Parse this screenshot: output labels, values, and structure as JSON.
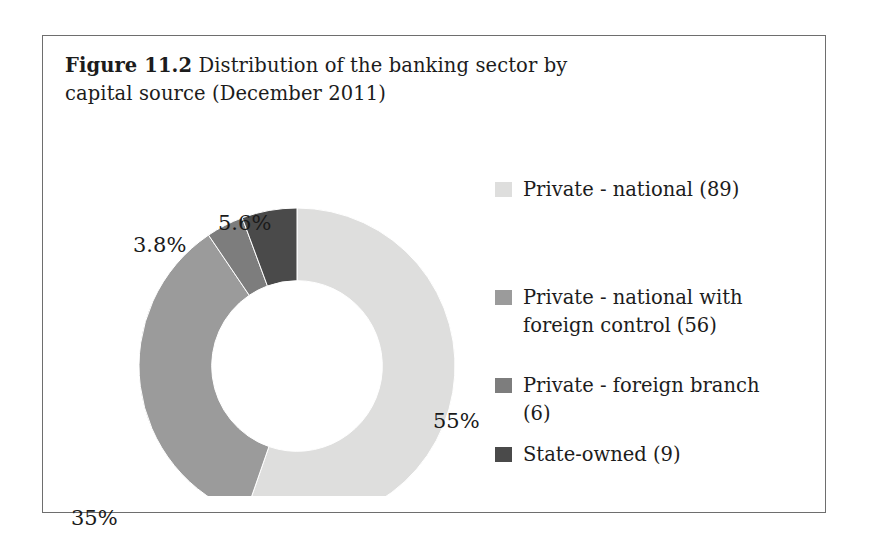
{
  "figure": {
    "label": "Figure 11.2",
    "title": "Distribution of the banking sector by capital source",
    "subtitle": "(December 2011)"
  },
  "chart_data": {
    "type": "pie",
    "variant": "donut",
    "title": "Distribution of the banking sector by capital source (December 2011)",
    "xlabel": "",
    "ylabel": "",
    "grid": false,
    "legend_position": "right",
    "hole_fraction": 0.54,
    "start_angle_deg": 0,
    "direction": "clockwise",
    "categories": [
      "Private - national (89)",
      "Private - national with foreign control (56)",
      "Private - foreign branch (6)",
      "State-owned (9)"
    ],
    "labels": [
      "55%",
      "35%",
      "3.8%",
      "5.6%"
    ],
    "values": [
      55,
      35,
      3.8,
      5.6
    ],
    "counts": [
      89,
      56,
      6,
      9
    ],
    "colors": [
      "#dededd",
      "#9b9b9b",
      "#7d7d7d",
      "#4a4a4a"
    ],
    "slices": [
      {
        "name": "Private - national",
        "count": 89,
        "percent": 55,
        "label": "55%",
        "color": "#dededd"
      },
      {
        "name": "Private - national with foreign control",
        "count": 56,
        "percent": 35,
        "label": "35%",
        "color": "#9b9b9b"
      },
      {
        "name": "Private - foreign branch",
        "count": 6,
        "percent": 3.8,
        "label": "3.8%",
        "color": "#7d7d7d"
      },
      {
        "name": "State-owned",
        "count": 9,
        "percent": 5.6,
        "label": "5.6%",
        "color": "#4a4a4a"
      }
    ]
  },
  "slice_labels": {
    "private_national": "55%",
    "national_foreign_control": "35%",
    "foreign_branch": "3.8%",
    "state_owned": "5.6%"
  },
  "legend": {
    "items": [
      {
        "label": "Private - national (89)",
        "color": "#dededd"
      },
      {
        "label": "Private - national with foreign control (56)",
        "color": "#9b9b9b"
      },
      {
        "label": "Private - foreign branch (6)",
        "color": "#7d7d7d"
      },
      {
        "label": "State-owned (9)",
        "color": "#4a4a4a"
      }
    ]
  },
  "style": {
    "frame_border": "#6e6e6e",
    "text_color": "#1c1c1c",
    "background": "#ffffff"
  }
}
